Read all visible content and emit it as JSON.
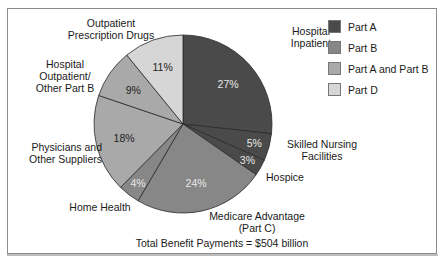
{
  "chart_data": {
    "type": "pie",
    "title": "",
    "caption": "Total Benefit Payments = $504 billion",
    "total": "$504 billion",
    "start_angle_deg": 0,
    "direction": "clockwise",
    "slices": [
      {
        "label": "Hospital Inpatient",
        "value": 27,
        "pct_label": "27%",
        "part": "Part A",
        "color": "#4a4a4a"
      },
      {
        "label": "Skilled Nursing Facilities",
        "value": 5,
        "pct_label": "5%",
        "part": "Part A",
        "color": "#4a4a4a"
      },
      {
        "label": "Hospice",
        "value": 3,
        "pct_label": "3%",
        "part": "Part A",
        "color": "#4a4a4a"
      },
      {
        "label": "Medicare Advantage (Part C)",
        "value": 24,
        "pct_label": "24%",
        "part": "Part B",
        "color": "#878787"
      },
      {
        "label": "Home Health",
        "value": 4,
        "pct_label": "4%",
        "part": "Part B",
        "color": "#878787"
      },
      {
        "label": "Physicians and Other Suppliers",
        "value": 18,
        "pct_label": "18%",
        "part": "Part A and Part B",
        "color": "#a9a9a9"
      },
      {
        "label": "Hospital Outpatient/ Other Part B",
        "value": 9,
        "pct_label": "9%",
        "part": "Part A and Part B",
        "color": "#a9a9a9"
      },
      {
        "label": "Outpatient Prescription Drugs",
        "value": 11,
        "pct_label": "11%",
        "part": "Part D",
        "color": "#d6d6d6"
      }
    ],
    "legend": {
      "position": "top-right",
      "entries": [
        {
          "label": "Part A",
          "color": "#4a4a4a"
        },
        {
          "label": "Part B",
          "color": "#878787"
        },
        {
          "label": "Part A and Part B",
          "color": "#a9a9a9"
        },
        {
          "label": "Part D",
          "color": "#d6d6d6"
        }
      ]
    }
  },
  "labels": {
    "hospital_inpatient": [
      "Hospital",
      "Inpatient"
    ],
    "snf": [
      "Skilled Nursing",
      "Facilities"
    ],
    "hospice": "Hospice",
    "medicare_advantage": [
      "Medicare Advantage",
      "(Part C)"
    ],
    "home_health": "Home Health",
    "physicians": [
      "Physicians and",
      "Other Suppliers"
    ],
    "hospital_outpatient": [
      "Hospital",
      "Outpatient/",
      "Other Part B"
    ],
    "drugs": [
      "Outpatient",
      "Prescription Drugs"
    ]
  },
  "caption": "Total Benefit Payments = $504 billion"
}
